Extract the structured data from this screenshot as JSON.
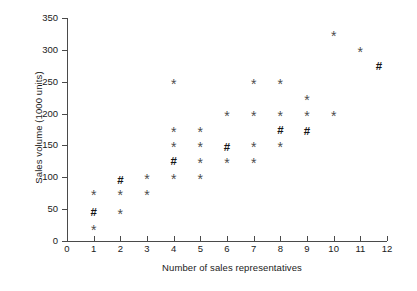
{
  "chart_data": {
    "type": "scatter",
    "title": "",
    "xlabel": "Number of sales representatives",
    "ylabel": "Sales volume (1000 units)",
    "xlim": [
      0,
      12
    ],
    "ylim": [
      0,
      350
    ],
    "xticks": [
      "0",
      "1",
      "2",
      "3",
      "4",
      "5",
      "6",
      "7",
      "8",
      "9",
      "10",
      "11",
      "12"
    ],
    "yticks": [
      "0",
      "50",
      "100",
      "150",
      "200",
      "250",
      "300",
      "350"
    ],
    "grid": false,
    "legend": "none",
    "marker_symbols": {
      "star": "*",
      "hash": "#"
    },
    "marker_color": "#4d4d4d",
    "points": [
      {
        "x": 1,
        "y": 75,
        "symbol": "*"
      },
      {
        "x": 1,
        "y": 45,
        "symbol": "#"
      },
      {
        "x": 1,
        "y": 20,
        "symbol": "*"
      },
      {
        "x": 2,
        "y": 95,
        "symbol": "#"
      },
      {
        "x": 2,
        "y": 75,
        "symbol": "*"
      },
      {
        "x": 2,
        "y": 45,
        "symbol": "*"
      },
      {
        "x": 3,
        "y": 100,
        "symbol": "*"
      },
      {
        "x": 3,
        "y": 75,
        "symbol": "*"
      },
      {
        "x": 4,
        "y": 250,
        "symbol": "*"
      },
      {
        "x": 4,
        "y": 175,
        "symbol": "*"
      },
      {
        "x": 4,
        "y": 150,
        "symbol": "*"
      },
      {
        "x": 4,
        "y": 125,
        "symbol": "#"
      },
      {
        "x": 4,
        "y": 100,
        "symbol": "*"
      },
      {
        "x": 5,
        "y": 175,
        "symbol": "*"
      },
      {
        "x": 5,
        "y": 150,
        "symbol": "*"
      },
      {
        "x": 5,
        "y": 125,
        "symbol": "*"
      },
      {
        "x": 5,
        "y": 100,
        "symbol": "*"
      },
      {
        "x": 6,
        "y": 200,
        "symbol": "*"
      },
      {
        "x": 6,
        "y": 148,
        "symbol": "#"
      },
      {
        "x": 6,
        "y": 125,
        "symbol": "*"
      },
      {
        "x": 7,
        "y": 250,
        "symbol": "*"
      },
      {
        "x": 7,
        "y": 200,
        "symbol": "*"
      },
      {
        "x": 7,
        "y": 150,
        "symbol": "*"
      },
      {
        "x": 7,
        "y": 125,
        "symbol": "*"
      },
      {
        "x": 8,
        "y": 250,
        "symbol": "*"
      },
      {
        "x": 8,
        "y": 200,
        "symbol": "*"
      },
      {
        "x": 8,
        "y": 175,
        "symbol": "#"
      },
      {
        "x": 8,
        "y": 150,
        "symbol": "*"
      },
      {
        "x": 9,
        "y": 225,
        "symbol": "*"
      },
      {
        "x": 9,
        "y": 200,
        "symbol": "*"
      },
      {
        "x": 9,
        "y": 173,
        "symbol": "#"
      },
      {
        "x": 10,
        "y": 325,
        "symbol": "*"
      },
      {
        "x": 10,
        "y": 200,
        "symbol": "*"
      },
      {
        "x": 11,
        "y": 300,
        "symbol": "*"
      },
      {
        "x": 11.7,
        "y": 275,
        "symbol": "#"
      }
    ]
  }
}
